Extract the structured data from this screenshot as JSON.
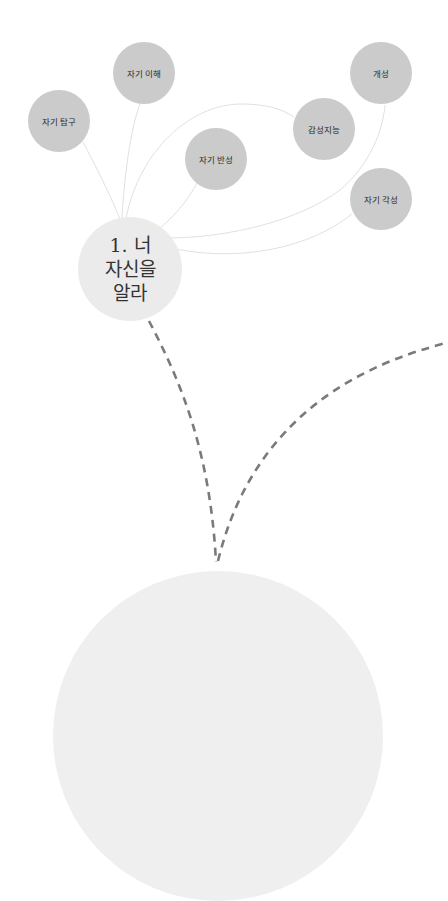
{
  "diagram": {
    "central_node": {
      "label": "1. 너\n자신을\n알라",
      "color": "#ebebeb"
    },
    "sub_nodes": [
      {
        "label": "자기 탐구",
        "color": "#cbcbcb"
      },
      {
        "label": "자기 이해",
        "color": "#cbcbcb"
      },
      {
        "label": "자기 반성",
        "color": "#cbcbcb"
      },
      {
        "label": "감성지능",
        "color": "#cbcbcb"
      },
      {
        "label": "개성",
        "color": "#cbcbcb"
      },
      {
        "label": "자기 각성",
        "color": "#cbcbcb"
      }
    ],
    "bottom_node": {
      "label": "",
      "color": "#efefef"
    },
    "connector_color": "#d9d9d9",
    "dashed_connector_color": "#7a7a7a"
  }
}
